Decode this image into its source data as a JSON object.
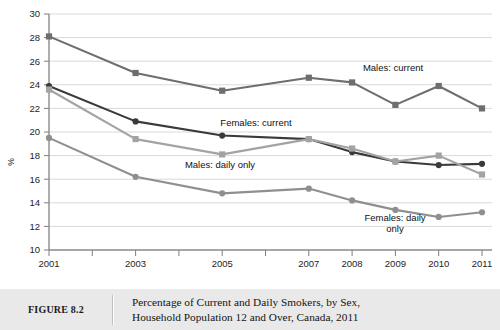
{
  "chart_data": {
    "type": "line",
    "title": "",
    "xlabel": "",
    "ylabel": "%",
    "categories": [
      "2001",
      "2003",
      "2005",
      "2007",
      "2008",
      "2009",
      "2010",
      "2011"
    ],
    "x_tick_labels": [
      "2001",
      "2003",
      "2005",
      "2007",
      "2008",
      "2009",
      "2010",
      "2011"
    ],
    "y_tick_labels": [
      "10",
      "12",
      "14",
      "16",
      "18",
      "20",
      "22",
      "24",
      "26",
      "28",
      "30"
    ],
    "ylim": [
      10,
      30
    ],
    "y_tick_step": 2,
    "grid": true,
    "legend_position": "inline-annotations",
    "series": [
      {
        "name": "Males: current",
        "color": "#6e6e6e",
        "marker": "square",
        "values": [
          28.1,
          25.0,
          23.5,
          24.6,
          24.2,
          22.3,
          23.9,
          22.0
        ]
      },
      {
        "name": "Females: current",
        "color": "#3a3a3a",
        "marker": "circle",
        "values": [
          23.9,
          20.9,
          19.7,
          19.4,
          18.3,
          17.5,
          17.2,
          17.3
        ]
      },
      {
        "name": "Males: daily only",
        "color": "#a3a3a3",
        "marker": "square",
        "values": [
          23.6,
          19.4,
          18.1,
          19.4,
          18.6,
          17.5,
          18.0,
          16.4
        ]
      },
      {
        "name": "Females: daily only",
        "color": "#8f8f8f",
        "marker": "circle",
        "values": [
          19.5,
          16.2,
          14.8,
          15.2,
          14.2,
          13.4,
          12.8,
          13.2
        ]
      }
    ],
    "annotations": [
      {
        "text": "Males: current",
        "series": "Males: current"
      },
      {
        "text": "Females: current",
        "series": "Females: current"
      },
      {
        "text": "Males: daily only",
        "series": "Males: daily only"
      },
      {
        "text": "Females: daily",
        "series": "Females: daily only"
      },
      {
        "text": "only",
        "series": "Females: daily only"
      }
    ]
  },
  "caption": {
    "figure_number": "FIGURE 8.2",
    "line1": "Percentage of Current and Daily Smokers, by Sex,",
    "line2": "Household Population 12 and Over, Canada, 2011"
  },
  "colors": {
    "caption_background": "#e9e9e9",
    "gridline": "#c9c9c9",
    "axis": "#8a8a8a"
  }
}
